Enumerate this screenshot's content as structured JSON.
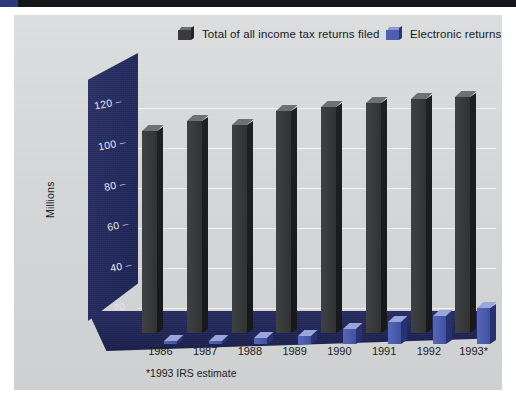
{
  "chart_data": {
    "type": "bar",
    "title": "",
    "subtitle": "",
    "xlabel": "",
    "ylabel": "Millions",
    "ylim": [
      0,
      130
    ],
    "yticks": [
      20,
      40,
      60,
      80,
      100,
      120
    ],
    "grid": true,
    "legend_position": "top",
    "categories": [
      "1986",
      "1987",
      "1988",
      "1989",
      "1990",
      "1991",
      "1992",
      "1993*"
    ],
    "series": [
      {
        "name": "Total of all income tax returns filed",
        "color": "#3a3b3d",
        "values": [
          102,
          107,
          105,
          112,
          114,
          116,
          118,
          119
        ]
      },
      {
        "name": "Electronic returns",
        "color": "#4c5cae",
        "values": [
          0.3,
          1.2,
          3.0,
          4.2,
          7.6,
          11.0,
          14.0,
          18.0
        ]
      }
    ],
    "footnote": "*1993 IRS estimate"
  },
  "legend": {
    "items": [
      {
        "label": "Total of all income tax returns filed",
        "swatch": "dark-bar-swatch"
      },
      {
        "label": "Electronic returns",
        "swatch": "blue-bar-swatch"
      }
    ]
  },
  "axis": {
    "y_title": "Millions",
    "y_ticks": [
      "120",
      "100",
      "80",
      "60",
      "40",
      "20"
    ],
    "x_ticks": [
      "1986",
      "1987",
      "1988",
      "1989",
      "1990",
      "1991",
      "1992",
      "1993*"
    ]
  },
  "footnote": {
    "text": "*1993 IRS estimate"
  },
  "colors": {
    "panel_background": "#d7d9da",
    "wall_navy": "#232a5e",
    "bar_dark": "#3a3b3d",
    "bar_blue": "#4c5cae",
    "gridline": "#ffffff"
  }
}
